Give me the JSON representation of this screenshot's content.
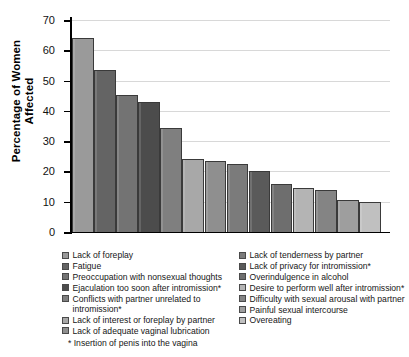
{
  "chart_data": {
    "type": "bar",
    "title": "",
    "xlabel": "",
    "ylabel": "Percentage of Women\nAffected",
    "ylim": [
      0,
      70
    ],
    "ytick_labels": [
      "70",
      "60",
      "50",
      "40",
      "30",
      "20",
      "10",
      "0"
    ],
    "yticks": [
      70,
      60,
      50,
      40,
      30,
      20,
      10,
      0
    ],
    "grid": true,
    "legend_position": "below-plot-two-columns",
    "categories": [
      "Lack of foreplay",
      "Fatigue",
      "Preoccupation with nonsexual thoughts",
      "Ejaculation too soon after intromission*",
      "Conflicts with partner unrelated to intromission*",
      "Lack of interest or foreplay by partner",
      "Lack of adequate vaginal lubrication",
      "Lack of tenderness by partner",
      "Lack of privacy for intromission*",
      "Overindulgence in alcohol",
      "Desire to perform well after intromission*",
      "Difficulty with sexual arousal with partner",
      "Painful sexual intercourse",
      "Overeating"
    ],
    "values": [
      64,
      53.5,
      45.3,
      43,
      34.5,
      24.2,
      23.5,
      22.5,
      20,
      16,
      14.6,
      14,
      10.7,
      10
    ],
    "colors": [
      "#9a9a9a",
      "#646464",
      "#737373",
      "#4c4c4c",
      "#7f7f7f",
      "#a8a8a8",
      "#8f8f8f",
      "#7b7b7b",
      "#5a5a5a",
      "#6e6e6e",
      "#b4b4b4",
      "#848484",
      "#9e9e9e",
      "#c0c0c0"
    ],
    "annotations": [
      "* Insertion of penis into the vagina"
    ]
  },
  "axis": {
    "y_title": "Percentage of Women\nAffected"
  },
  "legend": {
    "left_column": [
      "Lack of foreplay",
      "Fatigue",
      "Preoccupation with nonsexual thoughts",
      "Ejaculation too soon after intromission*",
      "Conflicts with partner unrelated to intromission*",
      "Lack of interest or foreplay by partner",
      "Lack of adequate vaginal lubrication"
    ],
    "right_column": [
      "Lack of tenderness by partner",
      "Lack of privacy for intromission*",
      "Overindulgence in alcohol",
      "Desire to perform well after intromission*",
      "Difficulty with sexual arousal with partner",
      "Painful sexual intercourse",
      "Overeating"
    ]
  },
  "footnote": "* Insertion of penis into the vagina"
}
